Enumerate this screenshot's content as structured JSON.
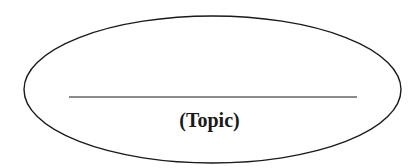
{
  "diagram": {
    "shape": "ellipse",
    "blank_line": "",
    "label": "(Topic)",
    "stroke_color": "#1a1a1a",
    "background": "#ffffff"
  }
}
